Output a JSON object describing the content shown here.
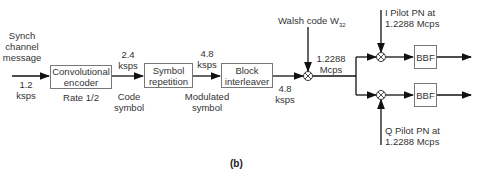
{
  "diagram": {
    "input": {
      "label_lines": [
        "Synch",
        "channel",
        "message"
      ],
      "rate_lines": [
        "1.2",
        "ksps"
      ]
    },
    "blocks": [
      {
        "id": "conv",
        "lines": [
          "Convolutional",
          "encoder"
        ],
        "sublabel": "Rate 1/2"
      },
      {
        "id": "symrep",
        "lines": [
          "Symbol",
          "repetition"
        ]
      },
      {
        "id": "interleaver",
        "lines": [
          "Block",
          "interleaver"
        ]
      },
      {
        "id": "bbf_i",
        "lines": [
          "BBF"
        ]
      },
      {
        "id": "bbf_q",
        "lines": [
          "BBF"
        ]
      }
    ],
    "rates": {
      "after_conv": [
        "2.4",
        "ksps"
      ],
      "after_conv_desc": [
        "Code",
        "symbol"
      ],
      "after_symrep": [
        "4.8",
        "ksps"
      ],
      "after_symrep_desc": [
        "Modulated",
        "symbol"
      ],
      "after_interleaver": [
        "4.8",
        "ksps"
      ],
      "after_walsh": [
        "1.2288",
        "Mcps"
      ]
    },
    "walsh": {
      "label": "Walsh code W",
      "subscript": "32"
    },
    "i_pilot": [
      "I Pilot PN at",
      "1.2288 Mcps"
    ],
    "q_pilot": [
      "Q Pilot PN at",
      "1.2288 Mcps"
    ],
    "mixer_symbol": "⊗"
  },
  "caption": "(b)"
}
